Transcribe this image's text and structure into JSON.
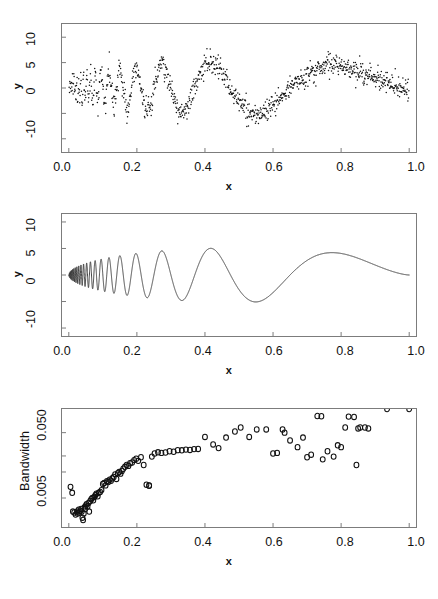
{
  "figure": {
    "background": "#ffffff",
    "frame_color": "#7c7c7c",
    "ink_color": "#111111",
    "bottom_artifact_text": " "
  },
  "panels": [
    {
      "name": "noisy-doppler-scatter",
      "ylabel": "y",
      "xlabel": "x"
    },
    {
      "name": "smooth-doppler-curve",
      "ylabel": "y",
      "xlabel": "x"
    },
    {
      "name": "local-bandwidth-scatter",
      "ylabel": "Bandwidth",
      "xlabel": "x"
    }
  ],
  "chart_data": [
    {
      "type": "scatter",
      "title": "",
      "xlabel": "x",
      "ylabel": "y",
      "xlim": [
        -0.02,
        1.02
      ],
      "ylim": [
        -12.6,
        12.6
      ],
      "xticks": [
        0.0,
        0.2,
        0.4,
        0.6,
        0.8,
        1.0
      ],
      "xticklabels": [
        "0.0",
        "0.2",
        "0.4",
        "0.6",
        "0.8",
        "1.0"
      ],
      "yticks": [
        -10,
        -5,
        0,
        5,
        10
      ],
      "yticklabels": [
        "-10",
        "",
        "0",
        "5",
        "10"
      ],
      "grid": false,
      "legend": false,
      "marker": "filled-dot",
      "marker_size": 1.2,
      "n_points": 1024,
      "description": "Noisy Doppler signal: y = 10*sqrt(x*(1-x))*sin(2*pi*1.05/(x+0.05)) + gaussian noise (sd ~ 1.1)",
      "generator": {
        "func": "doppler",
        "amplitude": 10.4,
        "eps": 0.05,
        "noise_sd": 1.1,
        "seed": 7
      }
    },
    {
      "type": "line",
      "title": "",
      "xlabel": "x",
      "ylabel": "y",
      "xlim": [
        -0.02,
        1.02
      ],
      "ylim": [
        -11.5,
        11.5
      ],
      "xticks": [
        0.0,
        0.2,
        0.4,
        0.6,
        0.8,
        1.0
      ],
      "xticklabels": [
        "0.0",
        "0.2",
        "0.4",
        "0.6",
        "0.8",
        "1.0"
      ],
      "yticks": [
        -10,
        -5,
        0,
        5,
        10
      ],
      "yticklabels": [
        "-10",
        "-5",
        "0",
        "5",
        "10"
      ],
      "grid": false,
      "legend": false,
      "line_color": "#333333",
      "line_width": 0.9,
      "description": "Smoothed / true Doppler curve: y = 10*sqrt(x*(1-x))*sin(2*pi*1.05/(x+0.05))",
      "generator": {
        "func": "doppler",
        "amplitude": 10.2,
        "eps": 0.05,
        "noise_sd": 0,
        "seed": 0
      }
    },
    {
      "type": "scatter",
      "title": "",
      "xlabel": "x",
      "ylabel": "Bandwidth",
      "yscale": "log",
      "xlim": [
        -0.02,
        1.02
      ],
      "ylim": [
        0.0018,
        0.115
      ],
      "xticks": [
        0.0,
        0.2,
        0.4,
        0.6,
        0.8,
        1.0
      ],
      "xticklabels": [
        "0.0",
        "0.2",
        "0.4",
        "0.6",
        "0.8",
        "1.0"
      ],
      "yticks": [
        0.005,
        0.05
      ],
      "yticklabels": [
        "0.005",
        "0.050"
      ],
      "grid": false,
      "legend": false,
      "marker": "open-circle",
      "marker_size": 4.2,
      "x": [
        0.005,
        0.01,
        0.012,
        0.016,
        0.02,
        0.024,
        0.026,
        0.029,
        0.031,
        0.034,
        0.036,
        0.038,
        0.04,
        0.042,
        0.044,
        0.046,
        0.048,
        0.05,
        0.052,
        0.055,
        0.058,
        0.06,
        0.063,
        0.066,
        0.069,
        0.072,
        0.075,
        0.078,
        0.081,
        0.085,
        0.088,
        0.092,
        0.096,
        0.1,
        0.104,
        0.108,
        0.112,
        0.116,
        0.12,
        0.124,
        0.128,
        0.132,
        0.136,
        0.14,
        0.144,
        0.148,
        0.152,
        0.156,
        0.16,
        0.165,
        0.17,
        0.175,
        0.18,
        0.186,
        0.192,
        0.198,
        0.204,
        0.212,
        0.22,
        0.228,
        0.236,
        0.236,
        0.244,
        0.252,
        0.262,
        0.272,
        0.284,
        0.296,
        0.308,
        0.32,
        0.332,
        0.344,
        0.356,
        0.368,
        0.38,
        0.4,
        0.424,
        0.44,
        0.462,
        0.488,
        0.505,
        0.53,
        0.552,
        0.58,
        0.6,
        0.612,
        0.628,
        0.634,
        0.65,
        0.672,
        0.688,
        0.7,
        0.712,
        0.73,
        0.742,
        0.746,
        0.76,
        0.778,
        0.79,
        0.8,
        0.812,
        0.822,
        0.838,
        0.845,
        0.85,
        0.856,
        0.87,
        0.88,
        0.935,
        1.0
      ],
      "y": [
        0.0074,
        0.006,
        0.0031,
        0.003,
        0.0028,
        0.0031,
        0.0029,
        0.0033,
        0.003,
        0.0032,
        0.0034,
        0.0031,
        0.0025,
        0.0023,
        0.0029,
        0.0036,
        0.0034,
        0.0038,
        0.004,
        0.0037,
        0.0042,
        0.0031,
        0.0045,
        0.0048,
        0.005,
        0.0046,
        0.0052,
        0.0055,
        0.0058,
        0.0053,
        0.006,
        0.0062,
        0.0066,
        0.0082,
        0.0085,
        0.0078,
        0.009,
        0.0088,
        0.0095,
        0.0092,
        0.01,
        0.0105,
        0.0115,
        0.0098,
        0.012,
        0.0125,
        0.0118,
        0.013,
        0.014,
        0.015,
        0.016,
        0.0155,
        0.017,
        0.0175,
        0.019,
        0.02,
        0.0185,
        0.021,
        0.016,
        0.008,
        0.0078,
        0.0077,
        0.0215,
        0.024,
        0.025,
        0.0245,
        0.0248,
        0.026,
        0.0255,
        0.027,
        0.0268,
        0.0275,
        0.0272,
        0.028,
        0.0282,
        0.043,
        0.033,
        0.029,
        0.042,
        0.052,
        0.06,
        0.043,
        0.056,
        0.056,
        0.024,
        0.0245,
        0.056,
        0.05,
        0.038,
        0.03,
        0.042,
        0.021,
        0.023,
        0.09,
        0.089,
        0.0195,
        0.026,
        0.0215,
        0.032,
        0.03,
        0.06,
        0.088,
        0.087,
        0.016,
        0.058,
        0.06,
        0.06,
        0.058
      ],
      "description": "Locally adaptive bandwidth vs x, plotted on a log y-axis; bandwidth grows from ~0.003 near x=0 to ~0.05-0.09 for larger x with scatter."
    }
  ]
}
